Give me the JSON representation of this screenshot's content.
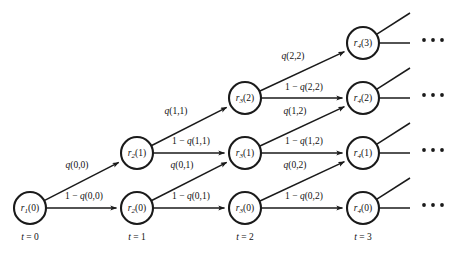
{
  "figure": {
    "kind": "trellis-state-transition-diagram",
    "background_color": "#ffffff",
    "stroke_color": "#1a1a1a",
    "width": 453,
    "height": 255
  },
  "nodes": [
    {
      "id": "n_t0_r0",
      "label_base": "r",
      "label_sub": "1",
      "label_arg": "(0)",
      "t": 0,
      "row": 0,
      "cx": 30,
      "cy": 208,
      "r": 16
    },
    {
      "id": "n_t1_r0",
      "label_base": "r",
      "label_sub": "2",
      "label_arg": "(0)",
      "t": 1,
      "row": 0,
      "cx": 137,
      "cy": 208,
      "r": 16
    },
    {
      "id": "n_t1_r1",
      "label_base": "r",
      "label_sub": "2",
      "label_arg": "(1)",
      "t": 1,
      "row": 1,
      "cx": 137,
      "cy": 153,
      "r": 16
    },
    {
      "id": "n_t2_r0",
      "label_base": "r",
      "label_sub": "3",
      "label_arg": "(0)",
      "t": 2,
      "row": 0,
      "cx": 245,
      "cy": 208,
      "r": 16
    },
    {
      "id": "n_t2_r1",
      "label_base": "r",
      "label_sub": "3",
      "label_arg": "(1)",
      "t": 2,
      "row": 1,
      "cx": 245,
      "cy": 153,
      "r": 16
    },
    {
      "id": "n_t2_r2",
      "label_base": "r",
      "label_sub": "3",
      "label_arg": "(2)",
      "t": 2,
      "row": 2,
      "cx": 245,
      "cy": 98,
      "r": 16
    },
    {
      "id": "n_t3_r0",
      "label_base": "r",
      "label_sub": "4",
      "label_arg": "(0)",
      "t": 3,
      "row": 0,
      "cx": 363,
      "cy": 208,
      "r": 16
    },
    {
      "id": "n_t3_r1",
      "label_base": "r",
      "label_sub": "4",
      "label_arg": "(1)",
      "t": 3,
      "row": 1,
      "cx": 363,
      "cy": 153,
      "r": 16
    },
    {
      "id": "n_t3_r2",
      "label_base": "r",
      "label_sub": "4",
      "label_arg": "(2)",
      "t": 3,
      "row": 2,
      "cx": 363,
      "cy": 98,
      "r": 16
    },
    {
      "id": "n_t3_r3",
      "label_base": "r",
      "label_sub": "4",
      "label_arg": "(3)",
      "t": 3,
      "row": 3,
      "cx": 363,
      "cy": 43,
      "r": 16
    }
  ],
  "edges": [
    {
      "id": "e_h_00",
      "from": "n_t0_r0",
      "to": "n_t1_r0",
      "kind": "horizontal",
      "label": "1 − q(0,0)",
      "label_x": 84,
      "label_y": 197
    },
    {
      "id": "e_d_00",
      "from": "n_t0_r0",
      "to": "n_t1_r1",
      "kind": "diagonal",
      "label": "q(0,0)",
      "label_x": 77,
      "label_y": 166
    },
    {
      "id": "e_h_01",
      "from": "n_t1_r0",
      "to": "n_t2_r0",
      "kind": "horizontal",
      "label": "1 − q(0,1)",
      "label_x": 191,
      "label_y": 197
    },
    {
      "id": "e_d_01",
      "from": "n_t1_r0",
      "to": "n_t2_r1",
      "kind": "diagonal",
      "label": "q(0,1)",
      "label_x": 182,
      "label_y": 166
    },
    {
      "id": "e_h_11",
      "from": "n_t1_r1",
      "to": "n_t2_r1",
      "kind": "horizontal",
      "label": "1 − q(1,1)",
      "label_x": 191,
      "label_y": 142
    },
    {
      "id": "e_d_11",
      "from": "n_t1_r1",
      "to": "n_t2_r2",
      "kind": "diagonal",
      "label": "q(1,1)",
      "label_x": 176,
      "label_y": 112
    },
    {
      "id": "e_h_02",
      "from": "n_t2_r0",
      "to": "n_t3_r0",
      "kind": "horizontal",
      "label": "1 − q(0,2)",
      "label_x": 304,
      "label_y": 197
    },
    {
      "id": "e_d_02",
      "from": "n_t2_r0",
      "to": "n_t3_r1",
      "kind": "diagonal",
      "label": "q(0,2)",
      "label_x": 295,
      "label_y": 166
    },
    {
      "id": "e_h_12",
      "from": "n_t2_r1",
      "to": "n_t3_r1",
      "kind": "horizontal",
      "label": "1 − q(1,2)",
      "label_x": 304,
      "label_y": 142
    },
    {
      "id": "e_d_12",
      "from": "n_t2_r1",
      "to": "n_t3_r2",
      "kind": "diagonal",
      "label": "q(1,2)",
      "label_x": 295,
      "label_y": 112
    },
    {
      "id": "e_h_22",
      "from": "n_t2_r2",
      "to": "n_t3_r2",
      "kind": "horizontal",
      "label": "1 − q(2,2)",
      "label_x": 304,
      "label_y": 88
    },
    {
      "id": "e_d_22",
      "from": "n_t2_r2",
      "to": "n_t3_r3",
      "kind": "diagonal",
      "label": "q(2,2)",
      "label_x": 293,
      "label_y": 57
    }
  ],
  "tails": [
    {
      "id": "tail_r0",
      "from": "n_t3_r0",
      "horizontal_to_x": 410,
      "diagonal_to_x": 410,
      "diagonal_to_y": 178
    },
    {
      "id": "tail_r1",
      "from": "n_t3_r1",
      "horizontal_to_x": 410,
      "diagonal_to_x": 410,
      "diagonal_to_y": 123
    },
    {
      "id": "tail_r2",
      "from": "n_t3_r2",
      "horizontal_to_x": 410,
      "diagonal_to_x": 410,
      "diagonal_to_y": 68
    },
    {
      "id": "tail_r3",
      "from": "n_t3_r3",
      "horizontal_to_x": 410,
      "diagonal_to_x": 410,
      "diagonal_to_y": 13
    }
  ],
  "ellipses": [
    {
      "id": "ell_r3",
      "cy": 40,
      "x_start": 424,
      "spacing": 9,
      "count": 3,
      "radius": 1.9
    },
    {
      "id": "ell_r2",
      "cy": 95,
      "x_start": 424,
      "spacing": 9,
      "count": 3,
      "radius": 1.9
    },
    {
      "id": "ell_r1",
      "cy": 150,
      "x_start": 424,
      "spacing": 9,
      "count": 3,
      "radius": 1.9
    },
    {
      "id": "ell_r0",
      "cy": 205,
      "x_start": 424,
      "spacing": 9,
      "count": 3,
      "radius": 1.9
    }
  ],
  "time_axis": {
    "var": "t",
    "ticks": [
      {
        "id": "t0",
        "value": "0",
        "text": "t = 0",
        "x": 30,
        "y": 238
      },
      {
        "id": "t1",
        "value": "1",
        "text": "t = 1",
        "x": 137,
        "y": 238
      },
      {
        "id": "t2",
        "value": "2",
        "text": "t = 2",
        "x": 245,
        "y": 238
      },
      {
        "id": "t3",
        "value": "3",
        "text": "t = 3",
        "x": 363,
        "y": 238
      }
    ]
  }
}
